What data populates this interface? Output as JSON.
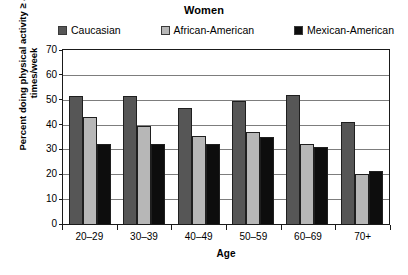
{
  "chart_data": {
    "type": "bar",
    "title": "Women",
    "xlabel": "Age",
    "ylabel": "Percent doing physical activity ≥ 4 times/week",
    "categories": [
      "20–29",
      "30–39",
      "40–49",
      "50–59",
      "60–69",
      "70+"
    ],
    "series": [
      {
        "name": "Caucasian",
        "color": "#565656",
        "values": [
          51.5,
          51.5,
          46.5,
          49.5,
          52,
          41
        ]
      },
      {
        "name": "African-American",
        "color": "#b7b7b7",
        "values": [
          43,
          39.5,
          35.5,
          37,
          32,
          20
        ]
      },
      {
        "name": "Mexican-American",
        "color": "#0d0d0d",
        "values": [
          32,
          32,
          32,
          35,
          31,
          21.5
        ]
      }
    ],
    "ylim": [
      0,
      70
    ],
    "yticks": [
      0,
      10,
      20,
      30,
      40,
      50,
      60,
      70
    ],
    "ytick_labels": [
      "0",
      "10",
      "20",
      "30",
      "40",
      "50",
      "60",
      "70"
    ],
    "grid": true,
    "legend_position": "top"
  },
  "legend": {
    "items": [
      {
        "label": "Caucasian"
      },
      {
        "label": "African-American"
      },
      {
        "label": "Mexican-American"
      }
    ]
  }
}
